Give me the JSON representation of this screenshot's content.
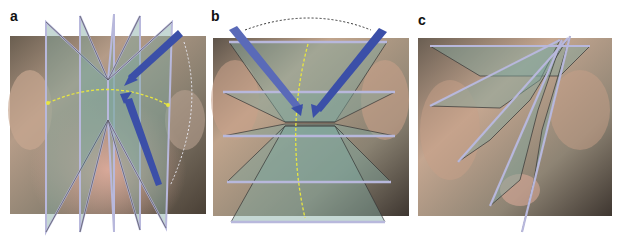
{
  "figure": {
    "panels": [
      {
        "label": "a",
        "description": "Vertical planes fanning around a central axis with blue arrows and yellow dashed arc"
      },
      {
        "label": "b",
        "description": "Horizontal planes stacked with converging blue arrows and dashed arc"
      },
      {
        "label": "c",
        "description": "Planes radiating from an upper-right pivot point"
      }
    ]
  },
  "colors": {
    "plane_fill": "#7fa8a0",
    "plane_edge": "#b8b8dc",
    "arrow_blue": "#3b4fa8",
    "arc_yellow": "#e8e640",
    "arc_dark": "#333333",
    "tissue_base": "#8a7a66",
    "tissue_pink": "#c89a86"
  }
}
